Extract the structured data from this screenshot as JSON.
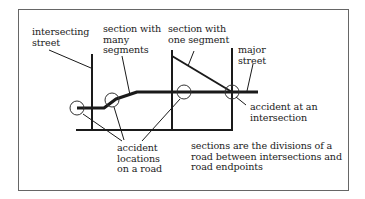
{
  "diagram": {
    "labels": {
      "intersecting_street": "intersecting\nstreet",
      "section_many_segments": "section with\nmany\nsegments",
      "section_one_segment": "section with\none segment",
      "major_street": "major\nstreet",
      "accident_at_intersection": "accident at an\nintersection",
      "accident_locations": "accident\nlocations\non a road",
      "caption": "sections are the divisions of a\nroad between intersections and\nroad endpoints"
    },
    "colors": {
      "line": "#1a1a1a",
      "border": "#555555",
      "background": "#ffffff"
    }
  }
}
